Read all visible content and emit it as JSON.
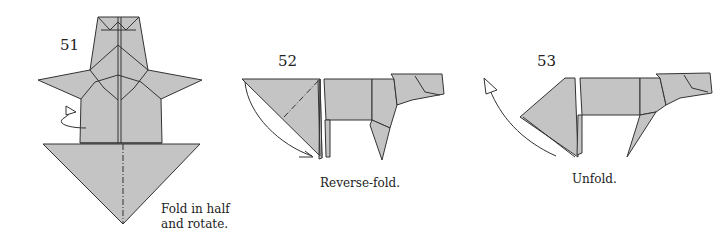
{
  "steps": [
    {
      "number": "51",
      "caption_line1": "Fold in half",
      "caption_line2": "and rotate."
    },
    {
      "number": "52",
      "caption": "Reverse-fold."
    },
    {
      "number": "53",
      "caption": "Unfold."
    }
  ],
  "colors": {
    "paper": "#c4c4c4",
    "line": "#333333",
    "background": "#ffffff"
  }
}
